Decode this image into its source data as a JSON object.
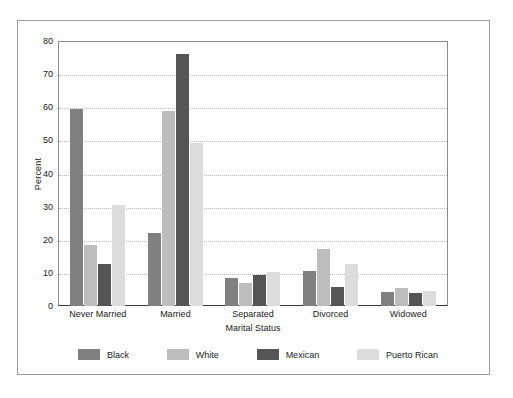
{
  "chart_data": {
    "type": "bar",
    "title": "",
    "xlabel": "Marital Status",
    "ylabel": "Percent",
    "categories": [
      "Never Married",
      "Married",
      "Separated",
      "Divorced",
      "Widowed"
    ],
    "ylim": [
      0,
      80
    ],
    "yticks": [
      0,
      10,
      20,
      30,
      40,
      50,
      60,
      70,
      80
    ],
    "grid": true,
    "legend_position": "bottom",
    "series": [
      {
        "name": "Black",
        "color": "#808080",
        "values": [
          59.5,
          22.0,
          8.5,
          10.5,
          4.3
        ]
      },
      {
        "name": "White",
        "color": "#bdbdbd",
        "values": [
          18.5,
          59.0,
          7.0,
          17.3,
          5.5
        ]
      },
      {
        "name": "Mexican",
        "color": "#555555",
        "values": [
          12.7,
          76.0,
          9.3,
          5.8,
          4.0
        ]
      },
      {
        "name": "Puerto Rican",
        "color": "#dcdcdc",
        "values": [
          30.6,
          49.2,
          10.2,
          12.6,
          4.4
        ]
      }
    ]
  }
}
